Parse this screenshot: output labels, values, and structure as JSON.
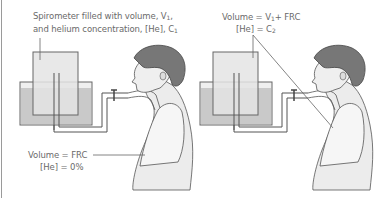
{
  "diagram": {
    "panels": [
      {
        "id": "before",
        "label_top_line1": "Spirometer filled with volume, V",
        "label_top_line1_sub": "1",
        "label_top_line1_end": ",",
        "label_top_line2": "and helium concentration, [He], C",
        "label_top_line2_sub": "1",
        "label_bottom_line1": "Volume = FRC",
        "label_bottom_line2": "[He] = 0%"
      },
      {
        "id": "after",
        "label_top_line1_a": "Volume = V",
        "label_top_line1_sub": "1",
        "label_top_line1_b": "+ FRC",
        "label_top_line2_a": "[He] = C",
        "label_top_line2_sub": "2"
      }
    ],
    "colors": {
      "outline": "#555555",
      "spirometer_bell": "#e6e6e6",
      "water": "#c8c8c8",
      "tank": "#efefef",
      "hair": "#7a7a7a",
      "skin": "#eeeeee",
      "lungs": "#f4f4f4",
      "label_text": "#6a6a6a",
      "left_border": "#9a9a9a"
    }
  }
}
